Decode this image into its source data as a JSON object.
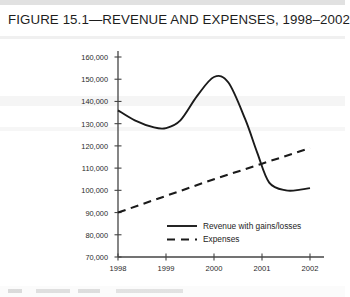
{
  "figure": {
    "title": "FIGURE 15.1—REVENUE AND EXPENSES, 1998–2002"
  },
  "chart_data": {
    "type": "line",
    "title": "FIGURE 15.1—REVENUE AND EXPENSES, 1998–2002",
    "xlabel": "",
    "ylabel": "",
    "x": [
      1998,
      1999,
      2000,
      2001,
      2002
    ],
    "xtick_labels": [
      "1998",
      "1999",
      "2000",
      "2001",
      "2002"
    ],
    "ytick_labels": [
      "160,000",
      "150,000",
      "140,000",
      "130,000",
      "120,000",
      "110,000",
      "100,000",
      "90,000",
      "80,000",
      "70,000"
    ],
    "ytick_values": [
      160000,
      150000,
      140000,
      130000,
      120000,
      110000,
      100000,
      90000,
      80000,
      70000
    ],
    "ylim": [
      70000,
      160000
    ],
    "xlim": [
      1998,
      2002
    ],
    "grid": false,
    "legend_position": "inside-bottom-center",
    "series": [
      {
        "name": "Revenue with gains/losses",
        "style": "solid",
        "color": "#1a1a1a",
        "values": [
          136000,
          128000,
          151000,
          104000,
          101000
        ],
        "detail_x": [
          1998.0,
          1998.35,
          1998.75,
          1999.0,
          1999.3,
          1999.65,
          2000.0,
          2000.3,
          2000.65,
          2000.9,
          2001.15,
          2001.5,
          2001.8,
          2002.0
        ],
        "detail_values": [
          136000,
          131500,
          128300,
          128000,
          131500,
          142500,
          151000,
          148500,
          132000,
          117000,
          103500,
          100000,
          100300,
          101000
        ]
      },
      {
        "name": "Expenses",
        "style": "dashed",
        "color": "#1a1a1a",
        "values": [
          90000,
          97500,
          105000,
          112000,
          119000
        ]
      }
    ]
  },
  "legend": {
    "items": [
      {
        "label": "Revenue with gains/losses",
        "style": "solid"
      },
      {
        "label": "Expenses",
        "style": "dashed"
      }
    ]
  }
}
